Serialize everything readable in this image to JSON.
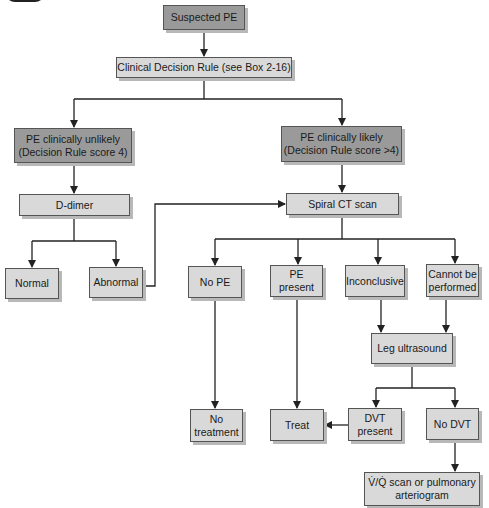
{
  "diagram": {
    "colors": {
      "dark_box": "#9a9a9a",
      "light_box": "#d9d9d9",
      "line": "#222222",
      "shadow": "#b8b8b8"
    },
    "nodes": {
      "suspected_pe": "Suspected PE",
      "clinical_rule": "Clinical Decision Rule (see Box 2-16)",
      "unlikely_l1": "PE clinically unlikely",
      "unlikely_l2": "(Decision Rule score 4)",
      "likely_l1": "PE clinically likely",
      "likely_l2": "(Decision Rule score >4)",
      "d_dimer": "D-dimer",
      "spiral_ct": "Spiral CT scan",
      "normal": "Normal",
      "abnormal": "Abnormal",
      "no_pe": "No PE",
      "pe_present_l1": "PE",
      "pe_present_l2": "present",
      "inconclusive": "Inconclusive",
      "cannot_l1": "Cannot be",
      "cannot_l2": "performed",
      "leg_us": "Leg ultrasound",
      "no_treat_l1": "No",
      "no_treat_l2": "treatment",
      "treat": "Treat",
      "dvt_l1": "DVT",
      "dvt_l2": "present",
      "no_dvt": "No DVT",
      "vq_l1": "V̇/Q̇ scan or pulmonary",
      "vq_l2": "arteriogram"
    },
    "edges": [
      [
        "Suspected PE",
        "Clinical Decision Rule"
      ],
      [
        "Clinical Decision Rule",
        "PE clinically unlikely"
      ],
      [
        "Clinical Decision Rule",
        "PE clinically likely"
      ],
      [
        "PE clinically unlikely",
        "D-dimer"
      ],
      [
        "PE clinically likely",
        "Spiral CT scan"
      ],
      [
        "D-dimer",
        "Normal"
      ],
      [
        "D-dimer",
        "Abnormal"
      ],
      [
        "Abnormal",
        "Spiral CT scan"
      ],
      [
        "Spiral CT scan",
        "No PE"
      ],
      [
        "Spiral CT scan",
        "PE present"
      ],
      [
        "Spiral CT scan",
        "Inconclusive"
      ],
      [
        "Spiral CT scan",
        "Cannot be performed"
      ],
      [
        "Inconclusive",
        "Leg ultrasound"
      ],
      [
        "Cannot be performed",
        "Leg ultrasound"
      ],
      [
        "No PE",
        "No treatment"
      ],
      [
        "PE present",
        "Treat"
      ],
      [
        "Leg ultrasound",
        "DVT present"
      ],
      [
        "Leg ultrasound",
        "No DVT"
      ],
      [
        "DVT present",
        "Treat"
      ],
      [
        "No DVT",
        "V/Q scan or pulmonary arteriogram"
      ]
    ]
  }
}
